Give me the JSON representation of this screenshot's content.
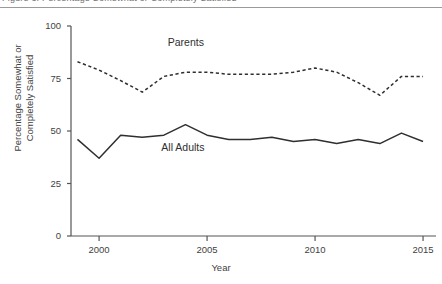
{
  "figure": {
    "caption_sliver": "Figure 3. Percentage Somewhat or Completely Satisfied",
    "background_color": "#ffffff",
    "rule_color": "#9a9a9a"
  },
  "chart_data": {
    "type": "line",
    "title": "",
    "xlabel": "Year",
    "ylabel": "Percentage Somewhat or Completely Satisfied",
    "x": [
      1999,
      2000,
      2001,
      2002,
      2003,
      2004,
      2005,
      2006,
      2007,
      2008,
      2009,
      2010,
      2011,
      2012,
      2013,
      2014,
      2015
    ],
    "xlim": [
      1998.7,
      2015.6
    ],
    "ylim": [
      0,
      100
    ],
    "xticks": [
      2000,
      2005,
      2010,
      2015
    ],
    "xtick_labels": [
      "2000",
      "2005",
      "2010",
      "2015"
    ],
    "yticks": [
      0,
      25,
      50,
      75,
      100
    ],
    "ytick_labels": [
      "0",
      "25",
      "50",
      "75",
      "100"
    ],
    "grid": false,
    "legend_position": "inline-annotations",
    "series": [
      {
        "name": "Parents",
        "style": "dashed",
        "color": "#2f2f2f",
        "label_x": 2004.2,
        "label_y": 92,
        "values": [
          83,
          79,
          74,
          68.5,
          76,
          78,
          78,
          77,
          77,
          77,
          78,
          80,
          78,
          73,
          67,
          76,
          76
        ]
      },
      {
        "name": "All Adults",
        "style": "solid",
        "color": "#2f2f2f",
        "label_x": 2003.9,
        "label_y": 42,
        "values": [
          46,
          37,
          48,
          47,
          48,
          53,
          48,
          46,
          46,
          47,
          45,
          46,
          44,
          46,
          44,
          49,
          45
        ]
      }
    ]
  },
  "axes": {
    "axis_color": "#555555",
    "tick_color": "#555555"
  }
}
